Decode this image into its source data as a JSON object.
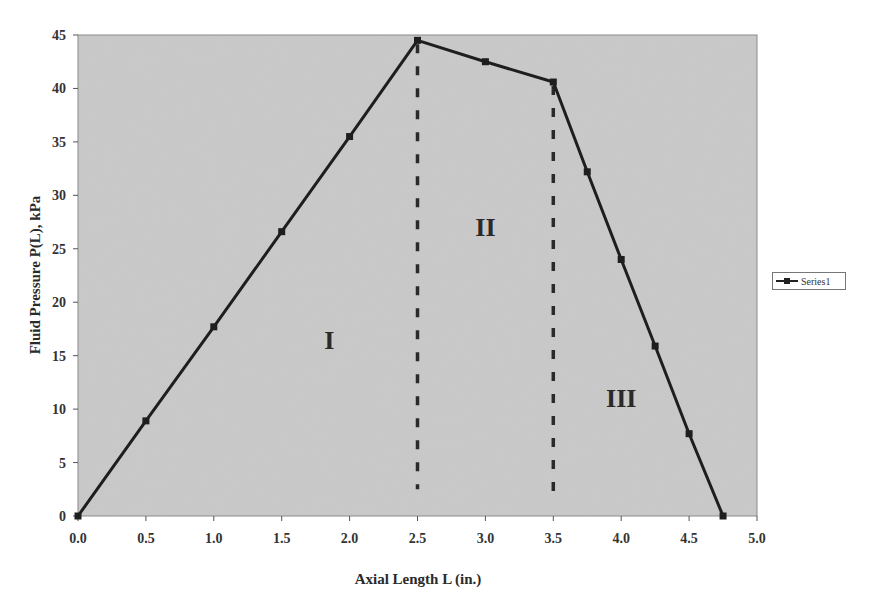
{
  "chart_data": {
    "type": "line",
    "title": "",
    "xlabel": "Axial Length L (in.)",
    "ylabel": "Fluid Pressure P(L), kPa",
    "xlim": [
      0,
      5
    ],
    "ylim": [
      0,
      45
    ],
    "x_ticks": [
      "0.0",
      "0.5",
      "1.0",
      "1.5",
      "2.0",
      "2.5",
      "3.0",
      "3.5",
      "4.0",
      "4.5",
      "5.0"
    ],
    "y_ticks": [
      "0",
      "5",
      "10",
      "15",
      "20",
      "25",
      "30",
      "35",
      "40",
      "45"
    ],
    "grid": false,
    "legend_position": "right",
    "series": [
      {
        "name": "Series1",
        "x": [
          0.0,
          0.5,
          1.0,
          1.5,
          2.0,
          2.5,
          3.0,
          3.5,
          3.75,
          4.0,
          4.25,
          4.5,
          4.75
        ],
        "values": [
          0.0,
          8.9,
          17.7,
          26.6,
          35.5,
          44.5,
          42.5,
          40.6,
          32.2,
          24.0,
          15.9,
          7.7,
          0.0
        ]
      }
    ],
    "annotations": [
      {
        "type": "region_label",
        "text": "I",
        "x": 1.85,
        "y": 16.5
      },
      {
        "type": "region_label",
        "text": "II",
        "x": 3.0,
        "y": 27
      },
      {
        "type": "region_label",
        "text": "III",
        "x": 4.0,
        "y": 11
      },
      {
        "type": "vertical_dashed_line",
        "x": 2.5,
        "y_from": 44.5,
        "y_to": 2.5
      },
      {
        "type": "vertical_dashed_line",
        "x": 3.5,
        "y_from": 40.6,
        "y_to": 1.5
      }
    ]
  },
  "legend": {
    "series_label": "Series1"
  },
  "colors": {
    "plot_background": "#c8c8c8",
    "line": "#1e1e1e",
    "axis": "#555555"
  }
}
